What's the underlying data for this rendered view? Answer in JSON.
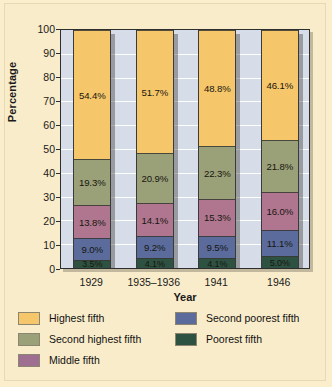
{
  "chart_data": {
    "type": "bar",
    "subtype": "stacked-100-percent",
    "title": "",
    "xlabel": "Year",
    "ylabel": "Percentage",
    "ylim": [
      0,
      100
    ],
    "ytick_step": 10,
    "yticks": [
      100,
      90,
      80,
      70,
      60,
      50,
      40,
      30,
      20,
      10,
      0
    ],
    "grid": true,
    "grid_orientation": "horizontal",
    "legend_position": "bottom",
    "categories": [
      "1929",
      "1935–1936",
      "1941",
      "1946"
    ],
    "stack_order_bottom_to_top": [
      "Poorest fifth",
      "Second poorest fifth",
      "Middle fifth",
      "Second highest fifth",
      "Highest fifth"
    ],
    "series": [
      {
        "name": "Highest fifth",
        "color": "#f6c66a",
        "values": [
          54.4,
          51.7,
          48.8,
          46.1
        ],
        "labels": [
          "54.4%",
          "51.7%",
          "48.8%",
          "46.1%"
        ]
      },
      {
        "name": "Second highest fifth",
        "color": "#9aa078",
        "values": [
          19.3,
          20.9,
          22.3,
          21.8
        ],
        "labels": [
          "19.3%",
          "20.9%",
          "22.3%",
          "21.8%"
        ]
      },
      {
        "name": "Middle fifth",
        "color": "#b0768f",
        "values": [
          13.8,
          14.1,
          15.3,
          16.0
        ],
        "labels": [
          "13.8%",
          "14.1%",
          "15.3%",
          "16.0%"
        ]
      },
      {
        "name": "Second poorest fifth",
        "color": "#5a6b9c",
        "values": [
          9.0,
          9.2,
          9.5,
          11.1
        ],
        "labels": [
          "9.0%",
          "9.2%",
          "9.5%",
          "11.1%"
        ]
      },
      {
        "name": "Poorest fifth",
        "color": "#2e5242",
        "values": [
          3.5,
          4.1,
          4.1,
          5.0
        ],
        "labels": [
          "3.5%",
          "4.1%",
          "4.1%",
          "5.0%"
        ]
      }
    ]
  },
  "legend": {
    "left_column": [
      {
        "label": "Highest fifth",
        "color": "#f6c66a"
      },
      {
        "label": "Second highest fifth",
        "color": "#9aa078"
      },
      {
        "label": "Middle fifth",
        "color": "#9f6f92"
      }
    ],
    "right_column": [
      {
        "label": "Second poorest fifth",
        "color": "#5a6b9c"
      },
      {
        "label": "Poorest fifth",
        "color": "#2e5242"
      }
    ]
  },
  "colors": {
    "figure_background": "#f9ecca",
    "plot_background": "#d6dde8",
    "gridline": "#ffffff",
    "axis": "#2e2e2e",
    "text": "#1a1a1a"
  }
}
